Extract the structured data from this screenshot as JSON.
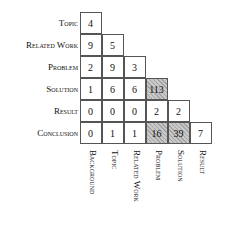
{
  "matrix": {
    "row_labels": [
      "Topic",
      "Related Work",
      "Problem",
      "Solution",
      "Result",
      "Conclusion"
    ],
    "col_labels": [
      "Background",
      "Topic",
      "Related Work",
      "Problem",
      "Solution",
      "Result"
    ],
    "rows": [
      {
        "label": "Topic",
        "cells": [
          "4"
        ]
      },
      {
        "label": "Related Work",
        "cells": [
          "9",
          "5"
        ]
      },
      {
        "label": "Problem",
        "cells": [
          "2",
          "9",
          "3"
        ]
      },
      {
        "label": "Solution",
        "cells": [
          "1",
          "6",
          "6",
          "113"
        ]
      },
      {
        "label": "Result",
        "cells": [
          "0",
          "0",
          "0",
          "2",
          "2"
        ]
      },
      {
        "label": "Conclusion",
        "cells": [
          "0",
          "1",
          "1",
          "16",
          "39",
          "7"
        ]
      }
    ],
    "highlighted_cells": [
      [
        3,
        3
      ],
      [
        5,
        3
      ],
      [
        5,
        4
      ]
    ],
    "highlight_color": "#c8c8c8"
  }
}
